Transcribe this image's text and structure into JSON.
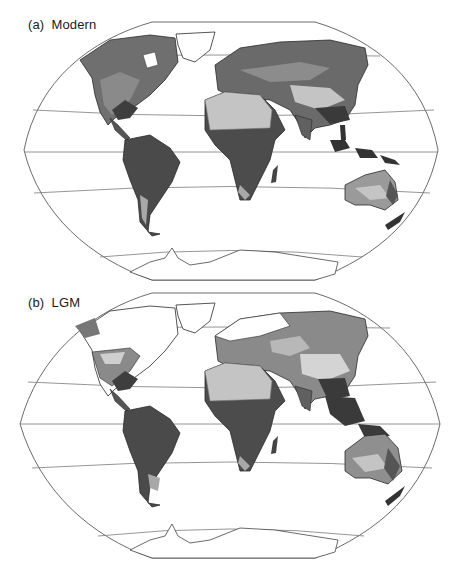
{
  "figure": {
    "panels": [
      {
        "id": "a",
        "label": "(a)  Modern",
        "period": "Modern"
      },
      {
        "id": "b",
        "label": "(b)  LGM",
        "period": "LGM"
      }
    ],
    "projection": "Robinson-like pseudocylindrical world map with flattened poles",
    "graticule_latitudes_deg": [
      -60,
      -30,
      0,
      30,
      60
    ],
    "colors": {
      "background": "#ffffff",
      "frame": "#6b6b6b",
      "grid": "#7a7a7a",
      "coast": "#222222",
      "land_dark": "#3a3a3a",
      "land_mid_dark": "#555555",
      "land_mid": "#7a7a7a",
      "land_light": "#a8a8a8",
      "land_pale": "#cfcfcf",
      "ice": "#ffffff"
    }
  }
}
